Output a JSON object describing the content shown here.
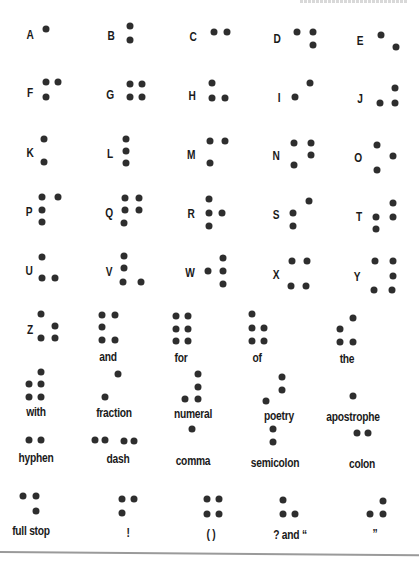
{
  "header_fragment": "",
  "cells": [
    {
      "id": "A",
      "label": "A",
      "kind": "letter",
      "lx": 30,
      "ly": 34,
      "dots": [
        [
          46,
          29
        ]
      ]
    },
    {
      "id": "B",
      "label": "B",
      "kind": "letter",
      "lx": 111,
      "ly": 35,
      "dots": [
        [
          130,
          26
        ],
        [
          130,
          40
        ]
      ]
    },
    {
      "id": "C",
      "label": "C",
      "kind": "letter",
      "lx": 193,
      "ly": 36,
      "dots": [
        [
          214,
          32
        ],
        [
          227,
          32
        ]
      ]
    },
    {
      "id": "D",
      "label": "D",
      "kind": "letter",
      "lx": 277,
      "ly": 38,
      "dots": [
        [
          297,
          32
        ],
        [
          313,
          32
        ],
        [
          313,
          45
        ]
      ]
    },
    {
      "id": "E",
      "label": "E",
      "kind": "letter",
      "lx": 360,
      "ly": 40,
      "dots": [
        [
          381,
          35
        ],
        [
          396,
          47
        ]
      ]
    },
    {
      "id": "F",
      "label": "F",
      "kind": "letter",
      "lx": 30,
      "ly": 92,
      "dots": [
        [
          46,
          82
        ],
        [
          58,
          82
        ],
        [
          46,
          97
        ]
      ]
    },
    {
      "id": "G",
      "label": "G",
      "kind": "letter",
      "lx": 110,
      "ly": 94,
      "dots": [
        [
          130,
          84
        ],
        [
          142,
          84
        ],
        [
          130,
          97
        ],
        [
          142,
          97
        ]
      ]
    },
    {
      "id": "H",
      "label": "H",
      "kind": "letter",
      "lx": 192,
      "ly": 95,
      "dots": [
        [
          212,
          83
        ],
        [
          212,
          98
        ],
        [
          225,
          98
        ]
      ]
    },
    {
      "id": "I",
      "label": "I",
      "kind": "letter",
      "lx": 279,
      "ly": 97,
      "dots": [
        [
          310,
          83
        ],
        [
          295,
          97
        ]
      ]
    },
    {
      "id": "J",
      "label": "J",
      "kind": "letter",
      "lx": 360,
      "ly": 98,
      "dots": [
        [
          395,
          88
        ],
        [
          380,
          103
        ],
        [
          395,
          103
        ]
      ]
    },
    {
      "id": "K",
      "label": "K",
      "kind": "letter",
      "lx": 30,
      "ly": 152,
      "dots": [
        [
          44,
          139
        ],
        [
          44,
          162
        ]
      ]
    },
    {
      "id": "L",
      "label": "L",
      "kind": "letter",
      "lx": 110,
      "ly": 153,
      "dots": [
        [
          126,
          139
        ],
        [
          126,
          151
        ],
        [
          126,
          163
        ]
      ]
    },
    {
      "id": "M",
      "label": "M",
      "kind": "letter",
      "lx": 191,
      "ly": 154,
      "dots": [
        [
          210,
          141
        ],
        [
          225,
          141
        ],
        [
          210,
          163
        ]
      ]
    },
    {
      "id": "N",
      "label": "N",
      "kind": "letter",
      "lx": 276,
      "ly": 155,
      "dots": [
        [
          294,
          143
        ],
        [
          311,
          143
        ],
        [
          311,
          155
        ],
        [
          294,
          165
        ]
      ]
    },
    {
      "id": "O",
      "label": "O",
      "kind": "letter",
      "lx": 358,
      "ly": 157,
      "dots": [
        [
          377,
          145
        ],
        [
          393,
          156
        ],
        [
          377,
          170
        ]
      ]
    },
    {
      "id": "P",
      "label": "P",
      "kind": "letter",
      "lx": 29,
      "ly": 211,
      "dots": [
        [
          42,
          197
        ],
        [
          58,
          197
        ],
        [
          42,
          210
        ],
        [
          42,
          222
        ]
      ]
    },
    {
      "id": "Q",
      "label": "Q",
      "kind": "letter",
      "lx": 109,
      "ly": 212,
      "dots": [
        [
          125,
          198
        ],
        [
          139,
          198
        ],
        [
          125,
          210
        ],
        [
          139,
          210
        ],
        [
          124,
          223
        ]
      ]
    },
    {
      "id": "R",
      "label": "R",
      "kind": "letter",
      "lx": 191,
      "ly": 213,
      "dots": [
        [
          209,
          199
        ],
        [
          209,
          213
        ],
        [
          222,
          213
        ],
        [
          209,
          226
        ]
      ]
    },
    {
      "id": "S",
      "label": "S",
      "kind": "letter",
      "lx": 276,
      "ly": 214,
      "dots": [
        [
          309,
          201
        ],
        [
          293,
          213
        ],
        [
          293,
          226
        ]
      ]
    },
    {
      "id": "T",
      "label": "T",
      "kind": "letter",
      "lx": 359,
      "ly": 216,
      "dots": [
        [
          393,
          203
        ],
        [
          376,
          217
        ],
        [
          393,
          217
        ],
        [
          376,
          229
        ]
      ]
    },
    {
      "id": "U",
      "label": "U",
      "kind": "letter",
      "lx": 29,
      "ly": 270,
      "dots": [
        [
          42,
          257
        ],
        [
          42,
          278
        ],
        [
          55,
          278
        ]
      ]
    },
    {
      "id": "V",
      "label": "V",
      "kind": "letter",
      "lx": 109,
      "ly": 271,
      "dots": [
        [
          124,
          256
        ],
        [
          124,
          268
        ],
        [
          123,
          282
        ],
        [
          141,
          282
        ]
      ]
    },
    {
      "id": "W",
      "label": "W",
      "kind": "letter",
      "lx": 190,
      "ly": 272,
      "dots": [
        [
          223,
          258
        ],
        [
          208,
          271
        ],
        [
          223,
          271
        ],
        [
          223,
          284
        ]
      ]
    },
    {
      "id": "X",
      "label": "X",
      "kind": "letter",
      "lx": 276,
      "ly": 274,
      "dots": [
        [
          292,
          261
        ],
        [
          307,
          261
        ],
        [
          291,
          286
        ],
        [
          306,
          286
        ]
      ]
    },
    {
      "id": "Y",
      "label": "Y",
      "kind": "letter",
      "lx": 357,
      "ly": 276,
      "dots": [
        [
          375,
          261
        ],
        [
          393,
          261
        ],
        [
          393,
          276
        ],
        [
          374,
          290
        ],
        [
          392,
          290
        ]
      ]
    },
    {
      "id": "Z",
      "label": "Z",
      "kind": "letter",
      "lx": 30,
      "ly": 329,
      "dots": [
        [
          41,
          314
        ],
        [
          55,
          326
        ],
        [
          41,
          338
        ],
        [
          55,
          338
        ]
      ]
    },
    {
      "id": "and",
      "label": "and",
      "kind": "word",
      "lx": 108,
      "ly": 357,
      "dots": [
        [
          102,
          315
        ],
        [
          115,
          315
        ],
        [
          102,
          327
        ],
        [
          102,
          340
        ],
        [
          115,
          340
        ]
      ]
    },
    {
      "id": "for",
      "label": "for",
      "kind": "word",
      "lx": 181,
      "ly": 358,
      "dots": [
        [
          176,
          316
        ],
        [
          188,
          316
        ],
        [
          176,
          329
        ],
        [
          188,
          329
        ],
        [
          176,
          341
        ],
        [
          188,
          341
        ]
      ]
    },
    {
      "id": "of",
      "label": "of",
      "kind": "word",
      "lx": 257,
      "ly": 358,
      "dots": [
        [
          252,
          314
        ],
        [
          252,
          328
        ],
        [
          264,
          328
        ],
        [
          252,
          341
        ],
        [
          264,
          341
        ]
      ]
    },
    {
      "id": "the",
      "label": "the",
      "kind": "word",
      "lx": 347,
      "ly": 359,
      "dots": [
        [
          353,
          318
        ],
        [
          340,
          329
        ],
        [
          340,
          342
        ],
        [
          353,
          342
        ]
      ]
    },
    {
      "id": "with",
      "label": "with",
      "kind": "word",
      "lx": 36,
      "ly": 412,
      "dots": [
        [
          41,
          372
        ],
        [
          29,
          384
        ],
        [
          41,
          384
        ],
        [
          29,
          397
        ],
        [
          41,
          397
        ]
      ]
    },
    {
      "id": "fraction",
      "label": "fraction",
      "kind": "word",
      "lx": 114,
      "ly": 413,
      "dots": [
        [
          118,
          374
        ],
        [
          105,
          397
        ]
      ]
    },
    {
      "id": "numeral",
      "label": "numeral",
      "kind": "word",
      "lx": 193,
      "ly": 414,
      "dots": [
        [
          198,
          374
        ],
        [
          198,
          387
        ],
        [
          185,
          399
        ],
        [
          198,
          399
        ]
      ]
    },
    {
      "id": "poetry",
      "label": "poetry",
      "kind": "word",
      "lx": 279,
      "ly": 416,
      "dots": [
        [
          282,
          377
        ],
        [
          282,
          390
        ],
        [
          266,
          401
        ]
      ]
    },
    {
      "id": "apostrophe",
      "label": "apostrophe",
      "kind": "word",
      "lx": 353,
      "ly": 417,
      "dots": [
        [
          353,
          396
        ]
      ]
    },
    {
      "id": "hyphen",
      "label": "hyphen",
      "kind": "word",
      "lx": 36,
      "ly": 458,
      "dots": [
        [
          29,
          440
        ],
        [
          41,
          440
        ]
      ]
    },
    {
      "id": "dash",
      "label": "dash",
      "kind": "word",
      "lx": 118,
      "ly": 459,
      "dots": [
        [
          95,
          440
        ],
        [
          105,
          440
        ],
        [
          124,
          441
        ],
        [
          134,
          441
        ]
      ]
    },
    {
      "id": "comma",
      "label": "comma",
      "kind": "word",
      "lx": 193,
      "ly": 461,
      "dots": [
        [
          192,
          429
        ]
      ]
    },
    {
      "id": "semicolon",
      "label": "semicolon",
      "kind": "word",
      "lx": 275,
      "ly": 463,
      "dots": [
        [
          273,
          429
        ],
        [
          273,
          442
        ]
      ]
    },
    {
      "id": "colon",
      "label": "colon",
      "kind": "word",
      "lx": 362,
      "ly": 464,
      "dots": [
        [
          357,
          433
        ],
        [
          368,
          433
        ]
      ]
    },
    {
      "id": "full-stop",
      "label": "full stop",
      "kind": "word",
      "lx": 31,
      "ly": 531,
      "dots": [
        [
          23,
          496
        ],
        [
          36,
          496
        ],
        [
          36,
          511
        ]
      ]
    },
    {
      "id": "exclamation",
      "label": "!",
      "kind": "word",
      "lx": 128,
      "ly": 533,
      "dots": [
        [
          122,
          499
        ],
        [
          134,
          499
        ],
        [
          122,
          513
        ]
      ]
    },
    {
      "id": "parentheses",
      "label": "( )",
      "kind": "word",
      "lx": 211,
      "ly": 534,
      "dots": [
        [
          207,
          499
        ],
        [
          219,
          499
        ],
        [
          207,
          514
        ],
        [
          219,
          514
        ]
      ]
    },
    {
      "id": "question-and-open-quote",
      "label": "? and “",
      "kind": "word",
      "lx": 290,
      "ly": 535,
      "dots": [
        [
          283,
          500
        ],
        [
          283,
          514
        ],
        [
          295,
          514
        ]
      ]
    },
    {
      "id": "close-quote",
      "label": "”",
      "kind": "word",
      "lx": 375,
      "ly": 534,
      "dots": [
        [
          383,
          501
        ],
        [
          370,
          514
        ],
        [
          383,
          514
        ]
      ]
    }
  ],
  "colors": {
    "dot": "#2e2e2e",
    "text": "#1a1a1a",
    "rule": "#9a9a9a",
    "background": "#ffffff"
  }
}
